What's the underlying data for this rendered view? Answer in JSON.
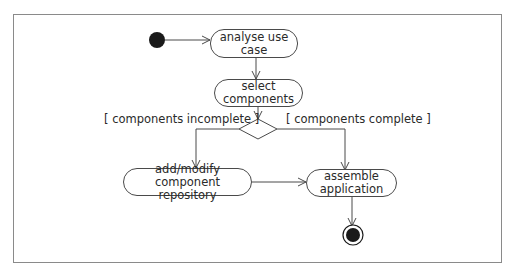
{
  "diagram": {
    "type": "UML activity diagram",
    "nodes": [
      {
        "id": "start",
        "kind": "initial"
      },
      {
        "id": "analyse",
        "kind": "action",
        "line1": "analyse use",
        "line2": "case"
      },
      {
        "id": "select",
        "kind": "action",
        "line1": "select",
        "line2": "components"
      },
      {
        "id": "decision",
        "kind": "decision"
      },
      {
        "id": "addmodify",
        "kind": "action",
        "line1": "add/modify component",
        "line2": "repository"
      },
      {
        "id": "assemble",
        "kind": "action",
        "line1": "assemble",
        "line2": "application"
      },
      {
        "id": "end",
        "kind": "final"
      }
    ],
    "guards": {
      "incomplete": "[ components incomplete ]",
      "complete": "[ components complete ]"
    },
    "edges": [
      {
        "from": "start",
        "to": "analyse"
      },
      {
        "from": "analyse",
        "to": "select"
      },
      {
        "from": "select",
        "to": "decision"
      },
      {
        "from": "decision",
        "to": "addmodify",
        "guard": "[ components incomplete ]"
      },
      {
        "from": "decision",
        "to": "assemble",
        "guard": "[ components complete ]"
      },
      {
        "from": "addmodify",
        "to": "assemble"
      },
      {
        "from": "assemble",
        "to": "end"
      }
    ],
    "colors": {
      "line": "#4a4a4a",
      "fill_dark": "#1a1a1a",
      "frame": "#8a8a8a"
    }
  }
}
